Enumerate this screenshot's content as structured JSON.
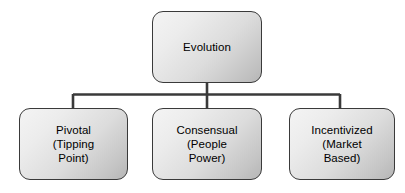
{
  "diagram": {
    "type": "org-chart",
    "background_color": "#ffffff",
    "box_border_color": "#3a3a3a",
    "box_fill_light": "#f4f4f4",
    "box_fill_dark": "#b6b6b6",
    "connector_color": "#3a3a3a",
    "text_color": "#000000",
    "root": {
      "label": "Evolution",
      "lines": [
        "Evolution"
      ]
    },
    "children": [
      {
        "label": "Pivotal\n(Tipping\nPoint)",
        "lines": [
          "Pivotal",
          "(Tipping",
          "Point)"
        ],
        "name": "Pivotal",
        "qualifier": "Tipping Point"
      },
      {
        "label": "Consensual\n(People\nPower)",
        "lines": [
          "Consensual",
          "(People",
          "Power)"
        ],
        "name": "Consensual",
        "qualifier": "People Power"
      },
      {
        "label": "Incentivized\n(Market\nBased)",
        "lines": [
          "Incentivized",
          "(Market",
          "Based)"
        ],
        "name": "Incentivized",
        "qualifier": "Market Based"
      }
    ]
  }
}
